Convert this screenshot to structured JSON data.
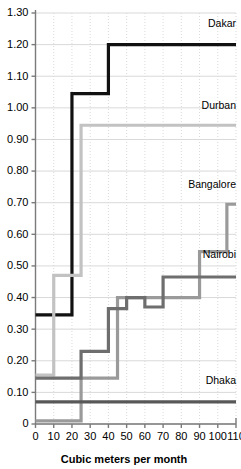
{
  "chart_data": {
    "type": "line",
    "title": "",
    "xlabel": "Cubic meters per month",
    "ylabel": "",
    "xlim": [
      0,
      110
    ],
    "ylim": [
      0,
      1.3
    ],
    "grid": true,
    "legend_position": "inline-right-of-series",
    "step_style": "post",
    "xticks": [
      0,
      10,
      20,
      30,
      40,
      50,
      60,
      70,
      80,
      90,
      100,
      110
    ],
    "xticklabels": [
      "0",
      "10",
      "20",
      "30",
      "40",
      "50",
      "60",
      "70",
      "80",
      "90",
      "100",
      "110"
    ],
    "yticks": [
      0,
      0.1,
      0.2,
      0.3,
      0.4,
      0.5,
      0.6,
      0.7,
      0.8,
      0.9,
      1.0,
      1.1,
      1.2,
      1.3
    ],
    "yticklabels": [
      "0",
      "0.10",
      "0.20",
      "0.30",
      "0.40",
      "0.50",
      "0.60",
      "0.70",
      "0.80",
      "0.90",
      "1.00",
      "1.10",
      "1.20",
      "1.30"
    ],
    "series": [
      {
        "name": "Dakar",
        "color": "#111111",
        "width": 3.2,
        "label_x": 110,
        "label_y": 1.255,
        "x": [
          0,
          10,
          20,
          40,
          110
        ],
        "y": [
          0.345,
          0.345,
          1.045,
          1.045,
          1.2
        ],
        "points": [
          {
            "x": 0,
            "y": 0.345
          },
          {
            "x": 10,
            "y": 0.345
          },
          {
            "x": 20,
            "y": 1.045
          },
          {
            "x": 40,
            "y": 1.2
          },
          {
            "x": 110,
            "y": 1.2
          }
        ]
      },
      {
        "name": "Durban",
        "color": "#c2c2c2",
        "width": 3.2,
        "label_x": 110,
        "label_y": 0.995,
        "x": [
          0,
          5,
          10,
          25,
          110
        ],
        "y": [
          0.155,
          0.155,
          0.47,
          0.945,
          0.945
        ],
        "points": [
          {
            "x": 0,
            "y": 0.155
          },
          {
            "x": 5,
            "y": 0.155
          },
          {
            "x": 10,
            "y": 0.47
          },
          {
            "x": 25,
            "y": 0.945
          },
          {
            "x": 110,
            "y": 0.945
          }
        ]
      },
      {
        "name": "Bangalore",
        "color": "#9a9a9a",
        "width": 3.2,
        "label_x": 110,
        "label_y": 0.745,
        "x": [
          0,
          10,
          25,
          45,
          90,
          105,
          110
        ],
        "y": [
          0.01,
          0.01,
          0.145,
          0.4,
          0.4,
          0.695,
          0.695
        ],
        "points": [
          {
            "x": 0,
            "y": 0.01
          },
          {
            "x": 10,
            "y": 0.01
          },
          {
            "x": 25,
            "y": 0.145
          },
          {
            "x": 45,
            "y": 0.4
          },
          {
            "x": 90,
            "y": 0.545
          },
          {
            "x": 105,
            "y": 0.695
          },
          {
            "x": 110,
            "y": 0.695
          }
        ]
      },
      {
        "name": "Nairobi",
        "color": "#6e6e6e",
        "width": 3.2,
        "label_x": 110,
        "label_y": 0.525,
        "x": [
          0,
          10,
          25,
          40,
          50,
          60,
          70,
          110
        ],
        "y": [
          0.145,
          0.145,
          0.23,
          0.365,
          0.4,
          0.37,
          0.465,
          0.465
        ],
        "points": [
          {
            "x": 0,
            "y": 0.145
          },
          {
            "x": 10,
            "y": 0.145
          },
          {
            "x": 25,
            "y": 0.23
          },
          {
            "x": 40,
            "y": 0.365
          },
          {
            "x": 50,
            "y": 0.4
          },
          {
            "x": 60,
            "y": 0.37
          },
          {
            "x": 70,
            "y": 0.465
          },
          {
            "x": 110,
            "y": 0.465
          }
        ]
      },
      {
        "name": "Dhaka",
        "color": "#585858",
        "width": 3.2,
        "label_x": 110,
        "label_y": 0.125,
        "x": [
          0,
          110
        ],
        "y": [
          0.07,
          0.07
        ],
        "points": [
          {
            "x": 0,
            "y": 0.07
          },
          {
            "x": 110,
            "y": 0.07
          }
        ]
      }
    ]
  }
}
